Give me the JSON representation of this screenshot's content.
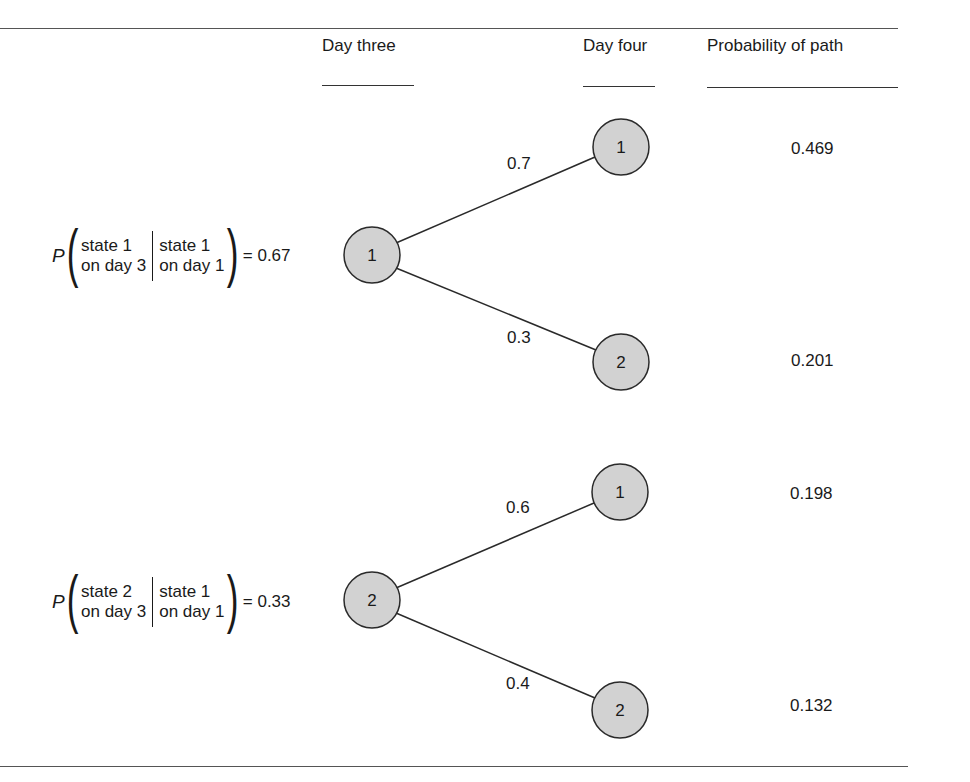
{
  "headers": {
    "day_three": "Day three",
    "day_four": "Day four",
    "probability_of_path": "Probability of path"
  },
  "conditions": [
    {
      "prefix": "P",
      "given_line1": "state 1",
      "given_line2": "on day 3",
      "cond_line1": "state 1",
      "cond_line2": "on day 1",
      "value": "= 0.67"
    },
    {
      "prefix": "P",
      "given_line1": "state 2",
      "given_line2": "on day 3",
      "cond_line1": "state 1",
      "cond_line2": "on day 1",
      "value": "= 0.33"
    }
  ],
  "day_three_nodes": [
    {
      "label": "1"
    },
    {
      "label": "2"
    }
  ],
  "day_four_nodes": [
    {
      "label": "1"
    },
    {
      "label": "2"
    },
    {
      "label": "1"
    },
    {
      "label": "2"
    }
  ],
  "branches": [
    {
      "from": "1",
      "to": "1",
      "probability": "0.7"
    },
    {
      "from": "1",
      "to": "2",
      "probability": "0.3"
    },
    {
      "from": "2",
      "to": "1",
      "probability": "0.6"
    },
    {
      "from": "2",
      "to": "2",
      "probability": "0.4"
    }
  ],
  "path_probabilities": [
    "0.469",
    "0.201",
    "0.198",
    "0.132"
  ],
  "colors": {
    "node_fill": "#d2d2d2",
    "node_stroke": "#2a2a2a",
    "line": "#2a2a2a",
    "rule": "#555555"
  }
}
